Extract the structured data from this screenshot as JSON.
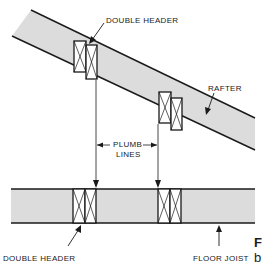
{
  "diagram": {
    "labels": {
      "double_header_top": "DOUBLE HEADER",
      "rafter": "RAFTER",
      "plumb_lines_1": "PLUMB",
      "plumb_lines_2": "LINES",
      "double_header_bottom": "DOUBLE HEADER",
      "floor_joist": "FLOOR JOIST"
    },
    "caption_fragment": {
      "line1": "F",
      "line2": "b"
    },
    "colors": {
      "member_fill": "#dcdcdc",
      "line": "#1a1a1a",
      "background": "#ffffff"
    }
  }
}
